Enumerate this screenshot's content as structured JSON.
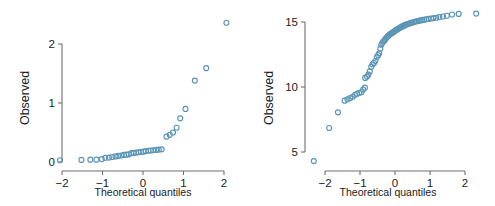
{
  "figure": {
    "background": "#ffffff",
    "marker_color": "#5b95b5",
    "axis_color": "#6f6f6f",
    "text_color": "#1b1b1b"
  },
  "chart_data": [
    {
      "type": "scatter",
      "panel": "left",
      "title": "",
      "xlabel": "Theoretical quantiles",
      "ylabel": "Observed",
      "xlim": [
        -2.45,
        2.35
      ],
      "ylim": [
        -0.08,
        2.45
      ],
      "xticks": [
        -2,
        -1,
        0,
        1,
        2
      ],
      "xticklabels": [
        "−2",
        "−1",
        "0",
        "1",
        "2"
      ],
      "yticks": [
        0,
        1,
        2
      ],
      "yticklabels": [
        "0",
        "1",
        "2"
      ],
      "grid": false,
      "legend": null,
      "marker": "open-circle",
      "points": [
        [
          -2.05,
          0.03
        ],
        [
          -1.52,
          0.035
        ],
        [
          -1.3,
          0.04
        ],
        [
          -1.15,
          0.04
        ],
        [
          -1.02,
          0.05
        ],
        [
          -0.93,
          0.07
        ],
        [
          -0.84,
          0.075
        ],
        [
          -0.76,
          0.085
        ],
        [
          -0.68,
          0.095
        ],
        [
          -0.61,
          0.105
        ],
        [
          -0.54,
          0.11
        ],
        [
          -0.47,
          0.12
        ],
        [
          -0.41,
          0.125
        ],
        [
          -0.35,
          0.13
        ],
        [
          -0.29,
          0.15
        ],
        [
          -0.23,
          0.155
        ],
        [
          -0.17,
          0.16
        ],
        [
          -0.11,
          0.165
        ],
        [
          -0.05,
          0.17
        ],
        [
          0.01,
          0.175
        ],
        [
          0.07,
          0.185
        ],
        [
          0.13,
          0.19
        ],
        [
          0.19,
          0.195
        ],
        [
          0.25,
          0.2
        ],
        [
          0.32,
          0.205
        ],
        [
          0.39,
          0.21
        ],
        [
          0.46,
          0.215
        ],
        [
          0.58,
          0.43
        ],
        [
          0.66,
          0.46
        ],
        [
          0.74,
          0.5
        ],
        [
          0.83,
          0.58
        ],
        [
          0.92,
          0.74
        ],
        [
          1.05,
          0.9
        ],
        [
          1.28,
          1.38
        ],
        [
          1.56,
          1.59
        ],
        [
          2.06,
          2.36
        ]
      ]
    },
    {
      "type": "scatter",
      "panel": "right",
      "title": "",
      "xlabel": "Theoretical quantiles",
      "ylabel": "Observed",
      "xlim": [
        -2.55,
        2.55
      ],
      "ylim": [
        3.6,
        16.6
      ],
      "xticks": [
        -2,
        -1,
        0,
        1,
        2
      ],
      "xticklabels": [
        "−2",
        "−1",
        "0",
        "1",
        "2"
      ],
      "yticks": [
        5,
        10,
        15
      ],
      "yticklabels": [
        "5",
        "10",
        "15"
      ],
      "grid": false,
      "legend": null,
      "marker": "open-circle",
      "points": [
        [
          -2.32,
          4.3
        ],
        [
          -1.88,
          6.85
        ],
        [
          -1.63,
          8.05
        ],
        [
          -1.44,
          8.95
        ],
        [
          -1.36,
          9.05
        ],
        [
          -1.28,
          9.15
        ],
        [
          -1.21,
          9.25
        ],
        [
          -1.14,
          9.4
        ],
        [
          -1.08,
          9.48
        ],
        [
          -1.02,
          9.55
        ],
        [
          -0.96,
          9.6
        ],
        [
          -0.91,
          9.8
        ],
        [
          -0.86,
          9.95
        ],
        [
          -0.85,
          10.7
        ],
        [
          -0.8,
          10.8
        ],
        [
          -0.76,
          10.95
        ],
        [
          -0.72,
          11.2
        ],
        [
          -0.68,
          11.55
        ],
        [
          -0.64,
          11.75
        ],
        [
          -0.6,
          11.85
        ],
        [
          -0.56,
          12.0
        ],
        [
          -0.52,
          12.3
        ],
        [
          -0.48,
          12.45
        ],
        [
          -0.45,
          12.6
        ],
        [
          -0.42,
          12.95
        ],
        [
          -0.39,
          13.25
        ],
        [
          -0.36,
          13.4
        ],
        [
          -0.33,
          13.5
        ],
        [
          -0.3,
          13.6
        ],
        [
          -0.27,
          13.7
        ],
        [
          -0.24,
          13.8
        ],
        [
          -0.21,
          13.9
        ],
        [
          -0.18,
          13.95
        ],
        [
          -0.15,
          14.05
        ],
        [
          -0.12,
          14.1
        ],
        [
          -0.09,
          14.15
        ],
        [
          -0.06,
          14.2
        ],
        [
          -0.03,
          14.25
        ],
        [
          0.0,
          14.32
        ],
        [
          0.03,
          14.38
        ],
        [
          0.06,
          14.42
        ],
        [
          0.09,
          14.48
        ],
        [
          0.12,
          14.52
        ],
        [
          0.15,
          14.58
        ],
        [
          0.18,
          14.62
        ],
        [
          0.21,
          14.66
        ],
        [
          0.24,
          14.7
        ],
        [
          0.27,
          14.74
        ],
        [
          0.3,
          14.78
        ],
        [
          0.34,
          14.82
        ],
        [
          0.38,
          14.86
        ],
        [
          0.42,
          14.9
        ],
        [
          0.46,
          14.93
        ],
        [
          0.5,
          14.96
        ],
        [
          0.54,
          15.0
        ],
        [
          0.58,
          15.03
        ],
        [
          0.63,
          15.06
        ],
        [
          0.68,
          15.09
        ],
        [
          0.73,
          15.12
        ],
        [
          0.78,
          15.15
        ],
        [
          0.84,
          15.18
        ],
        [
          0.9,
          15.21
        ],
        [
          0.96,
          15.24
        ],
        [
          1.03,
          15.27
        ],
        [
          1.1,
          15.3
        ],
        [
          1.18,
          15.33
        ],
        [
          1.27,
          15.38
        ],
        [
          1.37,
          15.42
        ],
        [
          1.48,
          15.48
        ],
        [
          1.63,
          15.58
        ],
        [
          1.82,
          15.62
        ],
        [
          2.32,
          15.65
        ]
      ]
    }
  ],
  "panels": {
    "left": {
      "name": "qq-plot-left",
      "ylabel": "Observed",
      "xlabel": "Theoretical quantiles",
      "yticklabels": [
        "0",
        "1",
        "2"
      ],
      "xticklabels": [
        "−2",
        "−1",
        "0",
        "1",
        "2"
      ]
    },
    "right": {
      "name": "qq-plot-right",
      "ylabel": "Observed",
      "xlabel": "Theoretical quantiles",
      "yticklabels": [
        "5",
        "10",
        "15"
      ],
      "xticklabels": [
        "−2",
        "−1",
        "0",
        "1",
        "2"
      ]
    }
  }
}
